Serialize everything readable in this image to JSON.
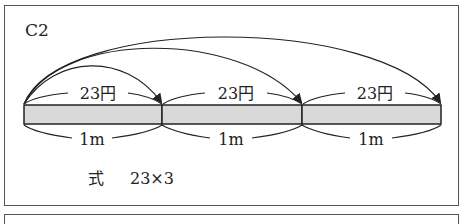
{
  "problem": {
    "label": "C2",
    "formula_prefix": "式",
    "formula": "23×3"
  },
  "diagram": {
    "segments": [
      {
        "price_label": "23円",
        "length_label": "1m"
      },
      {
        "price_label": "23円",
        "length_label": "1m"
      },
      {
        "price_label": "23円",
        "length_label": "1m"
      }
    ],
    "bar_fill": "#d9d9d9",
    "line_color": "#222222"
  }
}
